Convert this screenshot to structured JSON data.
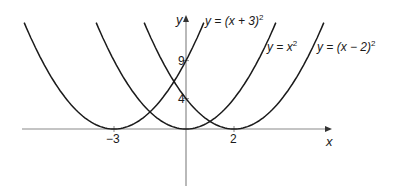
{
  "chart_data": {
    "type": "line",
    "title": "",
    "xlabel": "x",
    "ylabel": "y",
    "x_ticks": [
      -3,
      2
    ],
    "y_ticks": [
      4,
      9
    ],
    "grid": false,
    "legend": "inline labels near curve tops",
    "series": [
      {
        "name": "y = (x + 3)^2",
        "label_main": "y = (x + 3)",
        "exponent": "2",
        "h": -3
      },
      {
        "name": "y = x^2",
        "label_main": "y = x",
        "exponent": "2",
        "h": 0
      },
      {
        "name": "y = (x - 2)^2",
        "label_main": "y = (x − 2)",
        "exponent": "2",
        "h": 2
      }
    ],
    "xlim": [
      -6.8,
      8.4
    ],
    "ylim": [
      -8,
      15
    ]
  },
  "axes": {
    "x_label": "x",
    "y_label": "y",
    "x_tick_labels": [
      "−3",
      "2"
    ],
    "y_tick_labels": [
      "4",
      "9"
    ]
  },
  "style": {
    "curve_color": "#1a1a1a",
    "axis_color": "#8a8a8a"
  }
}
